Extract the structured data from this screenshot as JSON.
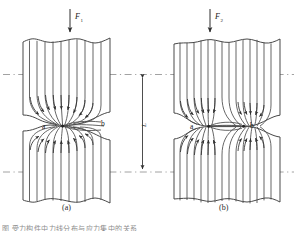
{
  "figure": {
    "type": "engineering-diagram",
    "background_color": "#ffffff",
    "line_color": "#3a3a3a",
    "dash_color": "#7a7a7a",
    "label_color": "#1a1a1a"
  },
  "panels": [
    {
      "id": "a",
      "caption": "(a)",
      "force_label": "F",
      "force_subscript": "1",
      "notch_labels": {
        "left": "a",
        "right": "b"
      },
      "notch_count": 1,
      "description": "single-sided sharp notch, flow lines converge to one point"
    },
    {
      "id": "b",
      "caption": "(b)",
      "force_label": "F",
      "force_subscript": "2",
      "notch_labels": {
        "left": "a",
        "right": "b"
      },
      "notch_count": 2,
      "description": "double-sided sharp notches, flow lines converge to two points"
    }
  ],
  "dimension": {
    "label": "L",
    "orientation": "vertical",
    "arrows": "both-ends"
  },
  "bottom_caption": "图    受力构件中力线分布与应力集中的关系"
}
